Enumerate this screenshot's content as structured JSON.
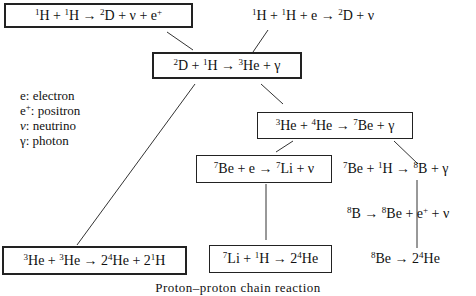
{
  "reactions": {
    "pp": {
      "parts": [
        "",
        "1",
        "H + ",
        "1",
        "H → ",
        "2",
        "D + ν + e",
        "+",
        ""
      ]
    },
    "pep": {
      "parts": [
        "",
        "1",
        "H + ",
        "1",
        "H + e → ",
        "2",
        "D + ν",
        "",
        ""
      ]
    },
    "d_capture": {
      "parts": [
        "",
        "2",
        "D + ",
        "1",
        "H → ",
        "3",
        "He + γ",
        "",
        ""
      ]
    },
    "he3_he4": {
      "parts": [
        "",
        "3",
        "He + ",
        "4",
        "He → ",
        "7",
        "Be + γ",
        "",
        ""
      ]
    },
    "be7_e": {
      "parts": [
        "",
        "7",
        "Be + e → ",
        "7",
        "Li + ν",
        "",
        "",
        "",
        ""
      ]
    },
    "be7_p": {
      "parts": [
        "",
        "7",
        "Be + ",
        "1",
        "H → ",
        "8",
        "B + γ",
        "",
        ""
      ]
    },
    "b8_decay": {
      "parts": [
        "",
        "8",
        "B → ",
        "8",
        "Be + e",
        "+",
        " + ν",
        "",
        ""
      ]
    },
    "he3_he3": {
      "parts": [
        "",
        "3",
        "He + ",
        "3",
        "He → 2",
        "4",
        "He + 2",
        "1",
        "H"
      ]
    },
    "li7_p": {
      "parts": [
        "",
        "7",
        "Li + ",
        "1",
        "H → 2",
        "4",
        "He",
        "",
        ""
      ]
    },
    "be8_decay": {
      "parts": [
        "",
        "8",
        "Be → 2",
        "4",
        "He",
        "",
        "",
        "",
        ""
      ]
    }
  },
  "legend": [
    {
      "symbol": "e",
      "sup": "",
      "label": ": electron"
    },
    {
      "symbol": "e",
      "sup": "+",
      "label": ": positron"
    },
    {
      "symbol": "ν",
      "sup": "",
      "label": ": neutrino"
    },
    {
      "symbol": "γ",
      "sup": "",
      "label": ": photon"
    }
  ],
  "caption": "Proton–proton chain reaction",
  "colors": {
    "line": "#333333",
    "border": "#222222",
    "text": "#111111"
  }
}
